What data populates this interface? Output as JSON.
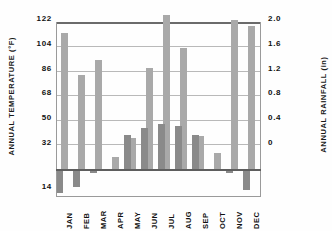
{
  "chart_data": {
    "type": "bar",
    "title": "",
    "categories": [
      "JAN",
      "FEB",
      "MAR",
      "APR",
      "MAY",
      "JUN",
      "JUL",
      "AUG",
      "SEP",
      "OCT",
      "NOV",
      "DEC"
    ],
    "series": [
      {
        "name": "Annual Temperature",
        "axis": "left",
        "unit": "°F",
        "color": "#a9a9a9",
        "values": [
          112,
          86,
          95,
          35,
          47,
          90,
          126,
          104,
          49,
          37,
          122,
          118
        ]
      },
      {
        "name": "Annual Rainfall",
        "axis": "right",
        "unit": "in",
        "color": "#8a8a8a",
        "values": [
          -0.6,
          -0.45,
          -0.02,
          0.26,
          0.4,
          0.49,
          0.54,
          0.51,
          0.39,
          0.13,
          -0.01,
          -0.5
        ]
      }
    ],
    "ylabel_left": "ANNUAL TEMPERATURE (°F)",
    "ylabel_right": "ANNUAL RAINFALL (in)",
    "xlabel": "",
    "yticks_left": [
      "122",
      "104",
      "86",
      "68",
      "50",
      "32",
      "14"
    ],
    "yticks_right": [
      "2.0",
      "1.6",
      "1.2",
      "0.8",
      "0.4",
      "0"
    ],
    "ylim_left": [
      14,
      122
    ],
    "ylim_right": [
      0,
      2.0
    ],
    "grid": true,
    "legend": "none"
  },
  "axes": {
    "left_title": "ANNUAL TEMPERATURE (°F)",
    "right_title": "ANNUAL RAINFALL (in)"
  },
  "ticks": {
    "left": [
      {
        "label": "122",
        "top": 14
      },
      {
        "label": "104",
        "top": 39
      },
      {
        "label": "86",
        "top": 64
      },
      {
        "label": "68",
        "top": 88
      },
      {
        "label": "50",
        "top": 113
      },
      {
        "label": "32",
        "top": 138
      },
      {
        "label": "14",
        "top": 182
      }
    ],
    "right": [
      {
        "label": "2.0",
        "top": 14
      },
      {
        "label": "1.6",
        "top": 39
      },
      {
        "label": "1.2",
        "top": 64
      },
      {
        "label": "0.8",
        "top": 88
      },
      {
        "label": "0.4",
        "top": 113
      },
      {
        "label": "0",
        "top": 138
      }
    ]
  },
  "gridlines": [
    {
      "top": 0,
      "strong": true
    },
    {
      "top": 24,
      "strong": false
    },
    {
      "top": 49,
      "strong": false
    },
    {
      "top": 73,
      "strong": false
    },
    {
      "top": 98,
      "strong": false
    },
    {
      "top": 122,
      "strong": false
    }
  ],
  "bars": [
    {
      "month": "JAN",
      "temp_left": 4.5,
      "temp_top": 11,
      "temp_height": 137,
      "rain_left": 0,
      "rain_top": 0,
      "rain_height": 22
    },
    {
      "month": "FEB",
      "temp_left": 21.5,
      "temp_top": 53,
      "temp_height": 95,
      "rain_left": 17,
      "rain_top": 0,
      "rain_height": 16
    },
    {
      "month": "MAR",
      "temp_left": 38.5,
      "temp_top": 38,
      "temp_height": 110,
      "rain_left": 34,
      "rain_top": 0,
      "rain_height": 2
    },
    {
      "month": "APR",
      "temp_left": 55.5,
      "temp_top": 135,
      "temp_height": 13,
      "rain_left": 51,
      "rain_top": 0,
      "rain_height": 0
    },
    {
      "month": "MAY",
      "temp_left": 72.5,
      "temp_top": 116,
      "temp_height": 32,
      "rain_left": 68,
      "rain_top": 113,
      "rain_height": 35
    },
    {
      "month": "JUN",
      "temp_left": 89.5,
      "temp_top": 46,
      "temp_height": 102,
      "rain_left": 85,
      "rain_top": 106,
      "rain_height": 42
    },
    {
      "month": "JUL",
      "temp_left": 106.5,
      "temp_top": -7,
      "temp_height": 155,
      "rain_left": 102,
      "rain_top": 102,
      "rain_height": 46
    },
    {
      "month": "AUG",
      "temp_left": 123.5,
      "temp_top": 26,
      "temp_height": 122,
      "rain_left": 119,
      "rain_top": 104,
      "rain_height": 44
    },
    {
      "month": "SEP",
      "temp_left": 140.5,
      "temp_top": 114,
      "temp_height": 34,
      "rain_left": 136,
      "rain_top": 113,
      "rain_height": 35
    },
    {
      "month": "OCT",
      "temp_left": 157.5,
      "temp_top": 131,
      "temp_height": 17,
      "rain_left": 153,
      "rain_top": 0,
      "rain_height": 0
    },
    {
      "month": "NOV",
      "temp_left": 174.5,
      "temp_top": -2,
      "temp_height": 150,
      "rain_left": 170,
      "rain_top": 0,
      "rain_height": 2
    },
    {
      "month": "DEC",
      "temp_left": 191.5,
      "temp_top": 4,
      "temp_height": 144,
      "rain_left": 187,
      "rain_top": 0,
      "rain_height": 19
    }
  ],
  "month_positions": [
    {
      "label": "JAN",
      "left": 9
    },
    {
      "label": "FEB",
      "left": 26
    },
    {
      "label": "MAR",
      "left": 43
    },
    {
      "label": "APR",
      "left": 60
    },
    {
      "label": "MAY",
      "left": 77
    },
    {
      "label": "JUN",
      "left": 94
    },
    {
      "label": "JUL",
      "left": 111
    },
    {
      "label": "AUG",
      "left": 128
    },
    {
      "label": "SEP",
      "left": 145
    },
    {
      "label": "OCT",
      "left": 162
    },
    {
      "label": "NOV",
      "left": 179
    },
    {
      "label": "DEC",
      "left": 196
    }
  ],
  "colors": {
    "temp_bar": "#a9a9a9",
    "rain_bar": "#8a8a8a",
    "gridline": "#b9b9b9",
    "axis": "#5e5e5e",
    "text": "#111111",
    "background": "#fefefe"
  }
}
